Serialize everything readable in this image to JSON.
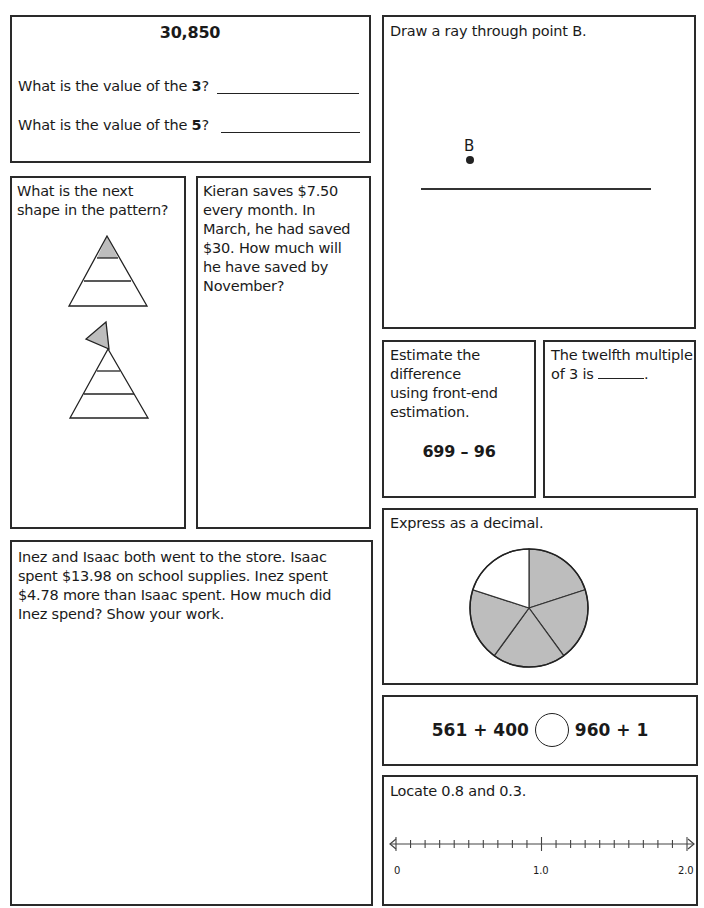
{
  "place_value": {
    "number": "30,850",
    "q1_prefix": "What is the value of the ",
    "q1_digit": "3",
    "q1_suffix": "?",
    "q2_prefix": "What is the value of the ",
    "q2_digit": "5",
    "q2_suffix": "?"
  },
  "pattern": {
    "question": "What is the next shape in the pattern?",
    "shapes": [
      {
        "name": "triangle-top-shaded",
        "shaded_part": "top"
      },
      {
        "name": "triangle-with-flag",
        "shaded_part": "flag"
      }
    ]
  },
  "savings": {
    "question": "Kieran saves $7.50 every month. In March, he had saved $30. How much will he have saved by November?"
  },
  "spending": {
    "question": "Inez and Isaac both went to the store. Isaac spent $13.98 on school supplies. Inez spent $4.78 more than Isaac spent. How much did Inez spend? Show your work."
  },
  "ray": {
    "question": "Draw a ray through point B.",
    "point_label": "B"
  },
  "estimate": {
    "question": "Estimate the difference using front-end estimation.",
    "line1": "Estimate the",
    "line2": "difference",
    "line3": "using front-end",
    "line4": "estimation.",
    "expression": "699 – 96"
  },
  "multiple": {
    "line1": "The twelfth multiple",
    "line2_prefix": "of 3 is ",
    "line2_suffix": "."
  },
  "decimal": {
    "question": "Express as a decimal.",
    "pie": {
      "slices": 5,
      "shaded": 4,
      "shade_color": "#bdbdbd"
    }
  },
  "compare": {
    "left": "561 + 400",
    "right": "960 + 1"
  },
  "number_line": {
    "question": "Locate 0.8 and 0.3.",
    "labels": [
      "0",
      "1.0",
      "2.0"
    ],
    "min": 0,
    "max": 2.0,
    "step": 0.1
  }
}
